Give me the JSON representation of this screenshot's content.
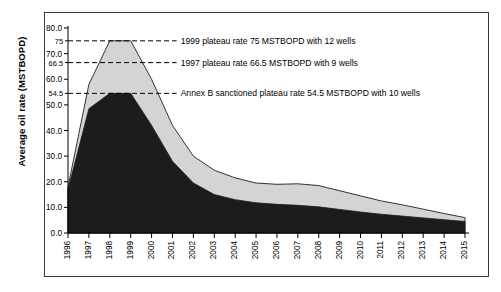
{
  "chart_data": {
    "type": "area",
    "title": "",
    "xlabel": "",
    "ylabel": "Average oil rate (MSTBOPD)",
    "ylim": [
      0,
      80
    ],
    "ytick_labels": [
      "0.0",
      "10.0",
      "20.0",
      "30.0",
      "40.0",
      "50.0",
      "60.0",
      "70.0",
      "80.0"
    ],
    "ytick_values": [
      0,
      10,
      20,
      30,
      40,
      50,
      60,
      70,
      80
    ],
    "ytick_minor_labels": [
      "54.5",
      "66.5",
      "75"
    ],
    "ytick_minor_values": [
      54.5,
      66.5,
      75
    ],
    "grid": false,
    "legend_position": "none",
    "categories": [
      "1996",
      "1997",
      "1998",
      "1999",
      "2000",
      "2001",
      "2002",
      "2003",
      "2004",
      "2005",
      "2006",
      "2007",
      "2008",
      "2009",
      "2010",
      "2011",
      "2012",
      "2013",
      "2014",
      "2015"
    ],
    "series": [
      {
        "name": "Upper profile",
        "fill_color": "#d4d4d4",
        "line_color": "#333333",
        "values": [
          18.0,
          58.0,
          75.0,
          75.0,
          60.0,
          42.0,
          30.0,
          24.5,
          21.5,
          19.5,
          19.0,
          19.2,
          18.5,
          16.5,
          14.5,
          12.5,
          11.0,
          9.3,
          7.6,
          6.0
        ]
      },
      {
        "name": "Annex B profile",
        "fill_color": "#1c1c1c",
        "line_color": "#1c1c1c",
        "values": [
          17.0,
          48.5,
          54.5,
          54.5,
          42.0,
          28.0,
          19.5,
          15.0,
          13.0,
          11.8,
          11.2,
          10.8,
          10.2,
          9.2,
          8.2,
          7.3,
          6.6,
          5.9,
          5.2,
          4.5
        ]
      }
    ],
    "annotations": [
      {
        "id": "plateau-1999",
        "text": "1999 plateau rate 75 MSTBOPD with 12 wells",
        "value": 75,
        "line_x_end_year": "2001.2"
      },
      {
        "id": "plateau-1997",
        "text": "1997 plateau rate 66.5 MSTBOPD with 9 wells",
        "value": 66.5,
        "line_x_end_year": "2001.2"
      },
      {
        "id": "annex-b",
        "text": "Annex B sanctioned plateau rate 54.5 MSTBOPD with 10 wells",
        "value": 54.5,
        "line_x_end_year": "2001.2"
      }
    ]
  }
}
